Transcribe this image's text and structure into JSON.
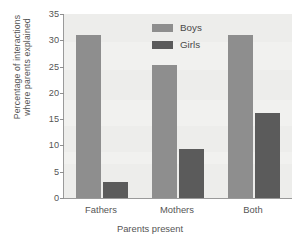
{
  "chart_data": {
    "type": "bar",
    "title": "",
    "xlabel": "Parents present",
    "ylabel_line1": "Percentage of interactions",
    "ylabel_line2": "where parents explained",
    "categories": [
      "Fathers",
      "Mothers",
      "Both"
    ],
    "series": [
      {
        "name": "Boys",
        "color": "#8e8e8e",
        "values": [
          31,
          25.3,
          31
        ]
      },
      {
        "name": "Girls",
        "color": "#5b5b5b",
        "values": [
          3,
          9.3,
          16.2
        ]
      }
    ],
    "ylim": [
      0,
      35
    ],
    "yticks": [
      0,
      5,
      10,
      15,
      20,
      25,
      30,
      35
    ],
    "ytick_labels": [
      "0",
      "5",
      "10",
      "15",
      "20",
      "25",
      "30",
      "35"
    ],
    "grid": false,
    "legend_position": "top-center",
    "plot_background": "#f1f1ef",
    "axis_color": "#9a9a9a",
    "text_color": "#555555"
  }
}
